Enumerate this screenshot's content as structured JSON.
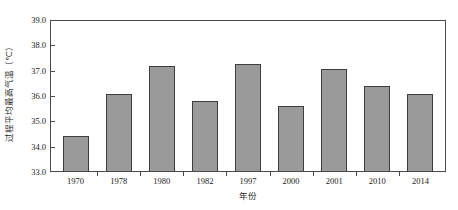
{
  "chart_data": {
    "type": "bar",
    "title": "",
    "subtitle": "",
    "xlabel": "年份",
    "ylabel": "过程平均最高气温（℃）",
    "categories": [
      "1970",
      "1978",
      "1980",
      "1982",
      "1997",
      "2000",
      "2001",
      "2010",
      "2014"
    ],
    "values": [
      34.4,
      36.1,
      37.2,
      35.8,
      37.3,
      35.6,
      37.1,
      36.4,
      36.1
    ],
    "series": [
      {
        "name": "过程平均最高气温",
        "values": [
          34.4,
          36.1,
          37.2,
          35.8,
          37.3,
          35.6,
          37.1,
          36.4,
          36.1
        ]
      }
    ],
    "ylim": [
      33.0,
      39.0
    ],
    "yticks": [
      "33.0",
      "34.0",
      "35.0",
      "36.0",
      "37.0",
      "38.0",
      "39.0"
    ],
    "ytick_values": [
      33.0,
      34.0,
      35.0,
      36.0,
      37.0,
      38.0,
      39.0
    ],
    "xticks": [
      "1970",
      "1978",
      "1980",
      "1982",
      "1997",
      "2000",
      "2001",
      "2010",
      "2014"
    ],
    "grid": false,
    "legend": false,
    "legend_position": "none",
    "annotations": [],
    "colors": {
      "bar_fill": "#9a9a9a",
      "bar_edge": "#3d3d3d",
      "axis": "#4a4a4a",
      "text": "#1a1a1a",
      "background": "#ffffff"
    }
  }
}
